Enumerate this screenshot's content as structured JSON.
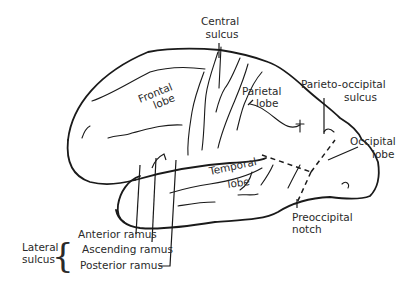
{
  "diagram": {
    "labels": {
      "central_sulcus": [
        "Central",
        "sulcus"
      ],
      "frontal_lobe": [
        "Frontal",
        "lobe"
      ],
      "parietal_lobe": [
        "Parietal",
        "lobe"
      ],
      "parieto_occipital_sulcus": [
        "Parieto-occipital",
        "sulcus"
      ],
      "occipital_lobe": [
        "Occipital",
        "lobe"
      ],
      "temporal_lobe": [
        "Temporal",
        "lobe"
      ],
      "preoccipital_notch": [
        "Preoccipital",
        "notch"
      ],
      "lateral_sulcus": [
        "Lateral",
        "sulcus"
      ],
      "anterior_ramus": "Anterior ramus",
      "ascending_ramus": "Ascending ramus",
      "posterior_ramus": "Posterior ramus"
    },
    "colors": {
      "line": "#1a1a1a",
      "text": "#2a2a2a",
      "background": "#ffffff"
    }
  }
}
